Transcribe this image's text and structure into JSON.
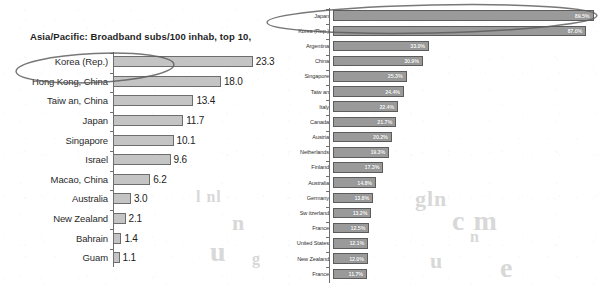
{
  "chart_data": [
    {
      "id": "left",
      "type": "bar",
      "orientation": "horizontal",
      "title": "Asia/Pacific: Broadband subs/100 inhab, top 10,",
      "xlabel": "",
      "ylabel": "",
      "value_suffix": "",
      "xlim": [
        0,
        25
      ],
      "grid": false,
      "legend": "none",
      "categories": [
        "Korea (Rep.)",
        "Hong Kong, China",
        "Taiw an, China",
        "Japan",
        "Singapore",
        "Israel",
        "Macao, China",
        "Australia",
        "New  Zealand",
        "Bahrain",
        "Guam"
      ],
      "values": [
        23.3,
        18.0,
        13.4,
        11.7,
        10.1,
        9.6,
        6.2,
        3.0,
        2.1,
        1.4,
        1.1
      ],
      "value_labels": [
        "23.3",
        "18.0",
        "13.4",
        "11.7",
        "10.1",
        "9.6",
        "6.2",
        "3.0",
        "2.1",
        "1.4",
        "1.1"
      ],
      "bar_fill": "#c4c4c4",
      "bar_stroke": "#6d6d6d"
    },
    {
      "id": "right",
      "type": "bar",
      "orientation": "horizontal",
      "title": "",
      "xlabel": "",
      "ylabel": "",
      "value_suffix": "%",
      "xlim": [
        0,
        90
      ],
      "grid": false,
      "legend": "none",
      "categories": [
        "Japan",
        "Korea (Rep.)",
        "Argentina",
        "China",
        "Singapore",
        "Taiw an",
        "Italy",
        "Canada",
        "Austria",
        "Netherlands",
        "Finland",
        "Australia",
        "Germany",
        "Sw itzerland",
        "France",
        "United States",
        "New  Zealand",
        "France"
      ],
      "values": [
        89.5,
        87.0,
        33.0,
        30.9,
        25.3,
        24.4,
        22.4,
        21.7,
        20.2,
        19.3,
        17.3,
        14.8,
        13.8,
        13.2,
        12.5,
        12.1,
        12.0,
        11.7
      ],
      "value_labels": [
        "89.5%",
        "87.0%",
        "33.0%",
        "30.9%",
        "25.3%",
        "24.4%",
        "22.4%",
        "21.7%",
        "20.2%",
        "19.3%",
        "17.3%",
        "14.8%",
        "13.8%",
        "13.2%",
        "12.5%",
        "12.1%",
        "12.0%",
        "11.7%"
      ],
      "bar_fill": "#9a9a9a",
      "bar_stroke": "#5c5c5c"
    }
  ],
  "annotations": {
    "left_ellipse": {
      "name": "korea-highlight-ellipse-left",
      "target": "Korea (Rep.)",
      "stroke": "#5a5a5a"
    },
    "right_ellipse": {
      "name": "top-two-highlight-ellipse-right",
      "target": "Japan / Korea (Rep.)",
      "stroke": "#5a5a5a"
    }
  },
  "ghost_text": [
    {
      "text": "l nl",
      "x": 196,
      "y": 188
    },
    {
      "text": "n",
      "x": 232,
      "y": 210
    },
    {
      "text": "u",
      "x": 210,
      "y": 236
    },
    {
      "text": "g",
      "x": 252,
      "y": 250
    },
    {
      "text": "gln",
      "x": 415,
      "y": 186
    },
    {
      "text": "c m",
      "x": 452,
      "y": 205
    },
    {
      "text": "n",
      "x": 470,
      "y": 228
    },
    {
      "text": "u",
      "x": 430,
      "y": 248
    },
    {
      "text": "e",
      "x": 500,
      "y": 252
    }
  ]
}
